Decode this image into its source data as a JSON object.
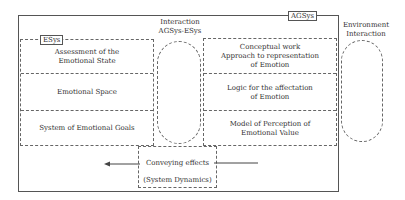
{
  "diagram": {
    "outer_label": "AGSys",
    "esys": {
      "label": "ESys",
      "rows": [
        [
          "Assessment of the",
          "Emotional State"
        ],
        [
          "Emotional Space"
        ],
        [
          "System of Emotional Goals"
        ]
      ]
    },
    "interaction_center": {
      "line1": "Interaction",
      "line2": "AGSys-ESys"
    },
    "right_box": {
      "rows": [
        [
          "Conceptual work",
          "Approach to representation",
          "of Emotion"
        ],
        [
          "Logic for the affectation",
          "of Emotion"
        ],
        [
          "Model of Perception of",
          "Emotional Value"
        ]
      ]
    },
    "environment": {
      "line1": "Environment",
      "line2": "Interaction"
    },
    "conveying": {
      "line1": "Conveying effects",
      "line2": "(System Dynamics)"
    },
    "colors": {
      "line": "#555555",
      "text": "#333333",
      "background": "#ffffff"
    }
  }
}
